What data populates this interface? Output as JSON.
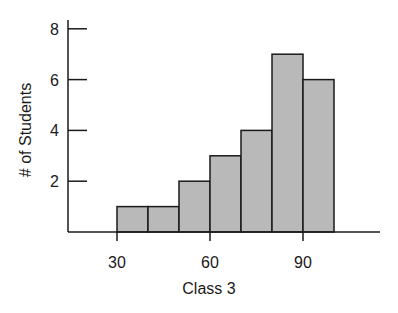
{
  "chart_data": {
    "type": "bar",
    "subtype": "histogram",
    "title": "",
    "xlabel": "Class 3",
    "ylabel": "# of Students",
    "bins": [
      {
        "start": 30,
        "end": 40,
        "count": 1
      },
      {
        "start": 40,
        "end": 50,
        "count": 1
      },
      {
        "start": 50,
        "end": 60,
        "count": 2
      },
      {
        "start": 60,
        "end": 70,
        "count": 3
      },
      {
        "start": 70,
        "end": 80,
        "count": 4
      },
      {
        "start": 80,
        "end": 90,
        "count": 7
      },
      {
        "start": 90,
        "end": 100,
        "count": 6
      }
    ],
    "categories": [
      "30-40",
      "40-50",
      "50-60",
      "60-70",
      "70-80",
      "80-90",
      "90-100"
    ],
    "values": [
      1,
      1,
      2,
      3,
      4,
      7,
      6
    ],
    "x_ticks": [
      30,
      60,
      90
    ],
    "y_ticks": [
      2,
      4,
      6,
      8
    ],
    "xlim": [
      14,
      114
    ],
    "ylim": [
      0,
      8.3
    ],
    "grid": false,
    "legend": null,
    "colors": {
      "bar_fill": "#b9b9b9",
      "bar_stroke": "#1a1a1a",
      "axis": "#1a1a1a",
      "background": "#ffffff"
    }
  }
}
